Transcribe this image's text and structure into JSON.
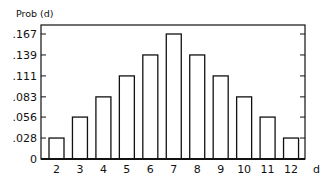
{
  "chart_data": {
    "type": "bar",
    "title": "",
    "ylabel": "Prob (d)",
    "xlabel": "d",
    "categories": [
      "2",
      "3",
      "4",
      "5",
      "6",
      "7",
      "8",
      "9",
      "10",
      "11",
      "12"
    ],
    "values": [
      0.028,
      0.056,
      0.083,
      0.111,
      0.139,
      0.167,
      0.139,
      0.111,
      0.083,
      0.056,
      0.028
    ],
    "yticks": [
      "0",
      ".028",
      ".056",
      ".083",
      ".111",
      ".139",
      ".167"
    ],
    "ytick_values": [
      0,
      0.028,
      0.056,
      0.083,
      0.111,
      0.139,
      0.167
    ],
    "ylim": [
      0,
      0.18
    ],
    "grid": false,
    "legend": null,
    "colors": {
      "bar_fill": "#ffffff",
      "stroke": "#111111"
    }
  }
}
